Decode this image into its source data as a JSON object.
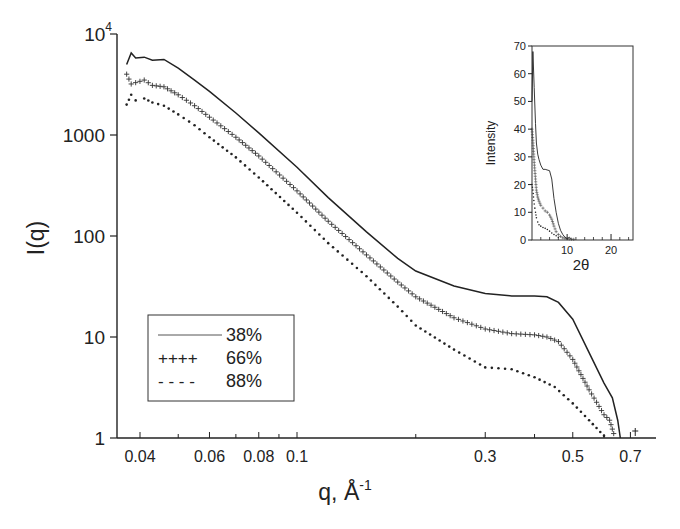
{
  "chart_data": [
    {
      "id": "main",
      "type": "line",
      "title": "",
      "xlabel": "q, Å",
      "xlabel_sup": "-1",
      "ylabel": "I(q)",
      "xscale": "log",
      "yscale": "log",
      "xlim": [
        0.036,
        0.77
      ],
      "ylim": [
        1,
        10000
      ],
      "grid": false,
      "legend_position": "lower-left",
      "x_ticks": [
        {
          "value": 0.04,
          "label": "0.04"
        },
        {
          "value": 0.05,
          "label": ""
        },
        {
          "value": 0.06,
          "label": "0.06"
        },
        {
          "value": 0.07,
          "label": ""
        },
        {
          "value": 0.08,
          "label": "0.08"
        },
        {
          "value": 0.09,
          "label": ""
        },
        {
          "value": 0.1,
          "label": "0.1"
        },
        {
          "value": 0.2,
          "label": ""
        },
        {
          "value": 0.3,
          "label": "0.3"
        },
        {
          "value": 0.4,
          "label": ""
        },
        {
          "value": 0.5,
          "label": "0.5"
        },
        {
          "value": 0.6,
          "label": ""
        },
        {
          "value": 0.7,
          "label": "0.7"
        }
      ],
      "y_ticks": [
        {
          "value": 1,
          "label": "1"
        },
        {
          "value": 10,
          "label": "10"
        },
        {
          "value": 100,
          "label": "100"
        },
        {
          "value": 1000,
          "label": "1000"
        },
        {
          "value": 10000,
          "label": "10",
          "sup": "4"
        }
      ],
      "series": [
        {
          "name": "38%",
          "legend_marker": "———",
          "style": "solid",
          "x": [
            0.037,
            0.038,
            0.039,
            0.041,
            0.043,
            0.046,
            0.05,
            0.055,
            0.06,
            0.07,
            0.08,
            0.1,
            0.12,
            0.15,
            0.18,
            0.2,
            0.25,
            0.3,
            0.35,
            0.4,
            0.43,
            0.46,
            0.5,
            0.55,
            0.6,
            0.63,
            0.65,
            0.66
          ],
          "y": [
            5000,
            6500,
            5800,
            5900,
            5500,
            5600,
            4600,
            3500,
            2700,
            1650,
            1050,
            480,
            240,
            110,
            60,
            45,
            32,
            27,
            25.5,
            25.5,
            25,
            22,
            15,
            7,
            3.5,
            2.5,
            1.5,
            1
          ]
        },
        {
          "name": "66%",
          "legend_marker": "++++",
          "style": "plus",
          "x": [
            0.037,
            0.038,
            0.039,
            0.041,
            0.043,
            0.046,
            0.05,
            0.055,
            0.06,
            0.07,
            0.08,
            0.1,
            0.12,
            0.15,
            0.18,
            0.2,
            0.25,
            0.3,
            0.35,
            0.4,
            0.43,
            0.46,
            0.5,
            0.55,
            0.6,
            0.62,
            0.64
          ],
          "y": [
            4000,
            3200,
            3300,
            3500,
            3100,
            3000,
            2500,
            1950,
            1500,
            950,
            620,
            280,
            140,
            65,
            35,
            25,
            15.5,
            12,
            10.8,
            10.5,
            10,
            9,
            6,
            3,
            1.7,
            1.5,
            1
          ]
        },
        {
          "name": "88%",
          "legend_marker": "- - - -",
          "style": "dotted",
          "x": [
            0.037,
            0.038,
            0.039,
            0.041,
            0.043,
            0.046,
            0.05,
            0.055,
            0.06,
            0.07,
            0.08,
            0.1,
            0.12,
            0.15,
            0.18,
            0.2,
            0.25,
            0.3,
            0.35,
            0.4,
            0.45,
            0.5,
            0.55,
            0.6,
            0.62
          ],
          "y": [
            2000,
            2500,
            2200,
            2300,
            2100,
            1950,
            1600,
            1250,
            950,
            600,
            380,
            170,
            85,
            40,
            20,
            13,
            7.5,
            5,
            4.8,
            4,
            3.2,
            2.2,
            1.5,
            1.05,
            1
          ]
        }
      ]
    },
    {
      "id": "inset",
      "type": "line",
      "title": "",
      "xlabel": "2θ",
      "ylabel": "Intensity",
      "xlim": [
        2,
        25
      ],
      "ylim": [
        0,
        70
      ],
      "grid": false,
      "x_ticks": [
        {
          "value": 10,
          "label": "10"
        },
        {
          "value": 20,
          "label": "20"
        }
      ],
      "x_minor_ticks": [
        4,
        6,
        8,
        12,
        14,
        16,
        18,
        22,
        24
      ],
      "y_ticks": [
        {
          "value": 0,
          "label": "0"
        },
        {
          "value": 10,
          "label": "10"
        },
        {
          "value": 20,
          "label": "20"
        },
        {
          "value": 30,
          "label": "30"
        },
        {
          "value": 40,
          "label": "40"
        },
        {
          "value": 50,
          "label": "50"
        },
        {
          "value": 60,
          "label": "60"
        },
        {
          "value": 70,
          "label": "70"
        }
      ],
      "series": [
        {
          "name": "38%",
          "style": "solid",
          "x": [
            2.0,
            2.2,
            2.5,
            2.8,
            3.0,
            3.3,
            3.6,
            4.0,
            4.5,
            5.0,
            6.0,
            6.5,
            7.0,
            7.5,
            8.0,
            8.5,
            9.0,
            9.5,
            10.0,
            10.5,
            11.0
          ],
          "y": [
            50,
            68,
            55,
            42,
            35,
            31,
            29,
            27,
            25.5,
            25.5,
            25,
            22,
            15,
            10,
            6,
            3.5,
            2,
            1,
            0.5,
            1,
            0.3
          ]
        },
        {
          "name": "66%",
          "style": "plus",
          "x": [
            2.0,
            2.2,
            2.5,
            2.8,
            3.0,
            3.3,
            3.6,
            4.0,
            4.5,
            5.0,
            5.5,
            6.0,
            6.5,
            7.0,
            7.5,
            8.0,
            8.5,
            9.0,
            10.0,
            11.0,
            12.0
          ],
          "y": [
            40,
            36,
            28,
            22,
            18,
            15.5,
            14,
            12.5,
            11.5,
            10.5,
            10,
            9,
            7.5,
            5,
            3,
            2,
            1.3,
            0.8,
            0.5,
            0.3,
            0.2
          ]
        },
        {
          "name": "88%",
          "style": "dotted",
          "x": [
            2.0,
            2.2,
            2.5,
            2.8,
            3.0,
            3.3,
            3.6,
            4.0,
            4.5,
            5.0,
            5.5,
            6.0,
            6.5,
            7.0,
            7.5,
            8.0,
            9.0
          ],
          "y": [
            20,
            18,
            13,
            10,
            8,
            6.5,
            5.5,
            5,
            4.5,
            4.2,
            3.8,
            3.2,
            2.5,
            2,
            1.5,
            1,
            0.4
          ]
        }
      ]
    }
  ],
  "legend": {
    "items": [
      {
        "marker": "———",
        "label": "38%"
      },
      {
        "marker": "++++",
        "label": "66%"
      },
      {
        "marker": "- - - -",
        "label": "88%"
      }
    ]
  },
  "colors": {
    "ink": "#222222",
    "background": "#ffffff"
  }
}
